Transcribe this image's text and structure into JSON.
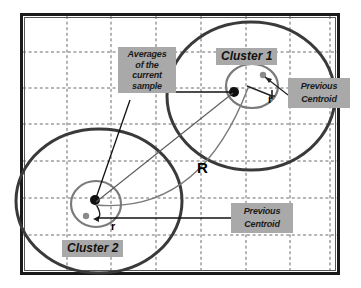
{
  "figure": {
    "title_text": "",
    "colors": {
      "label_background": "#a9a9a9",
      "label_text": "#1a1a1a",
      "outer_border": "#1a1a1a",
      "grid_line": "#6b6b6b",
      "outer_circle": "#3a3a3a",
      "inner_circle": "#7a7a7a",
      "current_centroid_dot": "#111111",
      "previous_centroid_dot": "#8a8a8a",
      "leader_line": "#222222",
      "radius_arc": "#7a7a7a",
      "plot_background": "#ffffff"
    },
    "grid": {
      "visible": true,
      "style": "dashed",
      "vertical_lines": 7,
      "horizontal_lines": 6
    }
  },
  "labels": {
    "averages_callout": "Averages\nof the\ncurrent\nsample",
    "cluster_one": "Cluster 1",
    "cluster_two": "Cluster 2",
    "previous_centroid_top": "Previous\nCentroid",
    "previous_centroid_bottom": "Previous\nCentroid",
    "radius_big": "R",
    "radius_small_cluster_one": "r",
    "radius_small_cluster_two": "r"
  },
  "clusters": [
    {
      "name": "Cluster 1",
      "outer_circle": {
        "cx": 251,
        "cy": 96,
        "rx": 84,
        "ry": 74
      },
      "inner_circle": {
        "cx": 252,
        "cy": 86,
        "rx": 26,
        "ry": 22
      },
      "current_centroid": {
        "x": 234,
        "y": 92,
        "radius": 5
      },
      "previous_centroid": {
        "x": 263,
        "y": 75,
        "radius": 3.2
      },
      "small_radius_label": "r"
    },
    {
      "name": "Cluster 2",
      "outer_circle": {
        "cx": 99,
        "cy": 201,
        "rx": 83,
        "ry": 72
      },
      "inner_circle": {
        "cx": 96,
        "cy": 204,
        "rx": 25,
        "ry": 23
      },
      "current_centroid": {
        "x": 95,
        "y": 200,
        "radius": 5
      },
      "previous_centroid": {
        "x": 86,
        "y": 216,
        "radius": 3.2
      },
      "small_radius_label": "r"
    }
  ],
  "annotations": {
    "big_radius_arc_label": "R",
    "leader_from_averages_to_cluster1": true,
    "leader_from_averages_to_cluster2": true,
    "leader_from_previous_centroid_top": true,
    "leader_from_previous_centroid_bottom": true
  }
}
